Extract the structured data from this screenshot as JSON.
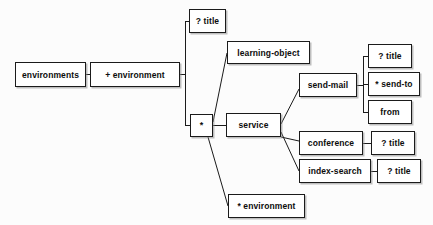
{
  "diagram": {
    "type": "tree",
    "background_color": "#fcfcfc",
    "box_fill_color": "#ffffff",
    "box_border_color": "#1b1b1b",
    "text_color": "#0d0d0d",
    "nodes": [
      {
        "id": "environments",
        "label": "environments",
        "x": 15,
        "y": 62,
        "w": 71,
        "h": 25
      },
      {
        "id": "plus-environment",
        "label": "+ environment",
        "x": 90,
        "y": 62,
        "w": 90,
        "h": 25
      },
      {
        "id": "title-1",
        "label": "? title",
        "x": 189,
        "y": 9,
        "w": 37,
        "h": 24
      },
      {
        "id": "star",
        "label": "*",
        "x": 190,
        "y": 114,
        "w": 23,
        "h": 23
      },
      {
        "id": "learning-object",
        "label": "learning-object",
        "x": 227,
        "y": 41,
        "w": 83,
        "h": 23
      },
      {
        "id": "service",
        "label": "service",
        "x": 226,
        "y": 113,
        "w": 55,
        "h": 24
      },
      {
        "id": "star-environment",
        "label": "* environment",
        "x": 228,
        "y": 194,
        "w": 77,
        "h": 24
      },
      {
        "id": "send-mail",
        "label": "send-mail",
        "x": 299,
        "y": 73,
        "w": 58,
        "h": 24
      },
      {
        "id": "conference",
        "label": "conference",
        "x": 299,
        "y": 131,
        "w": 64,
        "h": 24
      },
      {
        "id": "index-search",
        "label": "index-search",
        "x": 299,
        "y": 159,
        "w": 72,
        "h": 24
      },
      {
        "id": "title-2",
        "label": "? title",
        "x": 368,
        "y": 44,
        "w": 44,
        "h": 24
      },
      {
        "id": "send-to",
        "label": "* send-to",
        "x": 368,
        "y": 72,
        "w": 52,
        "h": 24
      },
      {
        "id": "from",
        "label": "from",
        "x": 368,
        "y": 100,
        "w": 44,
        "h": 24
      },
      {
        "id": "title-3",
        "label": "? title",
        "x": 371,
        "y": 131,
        "w": 44,
        "h": 24
      },
      {
        "id": "title-4",
        "label": "? title",
        "x": 377,
        "y": 159,
        "w": 44,
        "h": 24
      }
    ],
    "edges": [
      {
        "from": "environments",
        "to": "plus-environment",
        "style": "straight"
      },
      {
        "from": "plus-environment",
        "to": "title-1",
        "style": "orthogonal"
      },
      {
        "from": "plus-environment",
        "to": "star",
        "style": "orthogonal"
      },
      {
        "from": "star",
        "to": "learning-object",
        "style": "diagonal"
      },
      {
        "from": "star",
        "to": "service",
        "style": "straight"
      },
      {
        "from": "star",
        "to": "star-environment",
        "style": "diagonal"
      },
      {
        "from": "service",
        "to": "send-mail",
        "style": "diagonal"
      },
      {
        "from": "service",
        "to": "conference",
        "style": "straight"
      },
      {
        "from": "service",
        "to": "index-search",
        "style": "diagonal"
      },
      {
        "from": "send-mail",
        "to": "title-2",
        "style": "orthogonal"
      },
      {
        "from": "send-mail",
        "to": "send-to",
        "style": "orthogonal"
      },
      {
        "from": "send-mail",
        "to": "from",
        "style": "orthogonal"
      },
      {
        "from": "conference",
        "to": "title-3",
        "style": "straight"
      },
      {
        "from": "index-search",
        "to": "title-4",
        "style": "straight"
      }
    ]
  }
}
